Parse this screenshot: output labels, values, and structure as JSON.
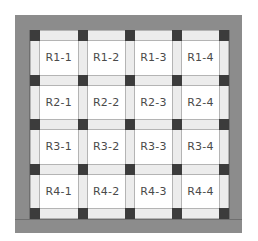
{
  "diagram": {
    "type": "quilt-grid",
    "rows": 4,
    "cols": 4,
    "colors": {
      "border": "#8c8c8c",
      "border_seam": "#6f6f6f",
      "post": "#3c3c3c",
      "sashing": "#ececec",
      "sashing_edge": "#b4b4b4",
      "block": "#ffffff",
      "label": "#4a4a4a"
    },
    "cells": [
      [
        "R1-1",
        "R1-2",
        "R1-3",
        "R1-4"
      ],
      [
        "R2-1",
        "R2-2",
        "R2-3",
        "R2-4"
      ],
      [
        "R3-1",
        "R3-2",
        "R3-3",
        "R3-4"
      ],
      [
        "R4-1",
        "R4-2",
        "R4-3",
        "R4-4"
      ]
    ]
  }
}
